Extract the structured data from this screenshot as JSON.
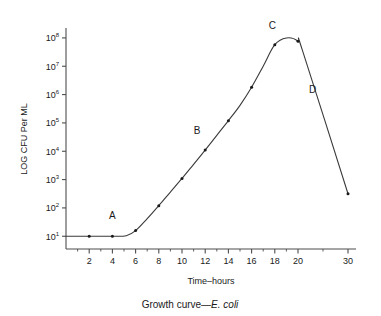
{
  "chart_data": {
    "type": "line",
    "title": "",
    "caption_prefix": "Growth curve—",
    "caption_italic": "E. coli",
    "xlabel": "Time–hours",
    "ylabel": "LOG CFU Per ML",
    "x_tick_labels": [
      "2",
      "4",
      "6",
      "8",
      "10",
      "12",
      "14",
      "16",
      "18",
      "20",
      "30"
    ],
    "x_tick_values": [
      2,
      4,
      6,
      8,
      10,
      12,
      14,
      16,
      18,
      20,
      30
    ],
    "x_minor_tick_values": [
      1,
      3,
      5,
      7,
      9,
      11,
      13,
      15,
      17,
      19,
      25
    ],
    "y_tick_labels": [
      "10¹",
      "10²",
      "10³",
      "10⁴",
      "10⁵",
      "10⁶",
      "10⁷",
      "10⁸"
    ],
    "y_tick_mantissa": "10",
    "y_tick_exponents": [
      "1",
      "2",
      "3",
      "4",
      "5",
      "6",
      "7",
      "8"
    ],
    "y_tick_values": [
      10,
      100,
      1000,
      10000,
      100000,
      1000000,
      10000000,
      100000000
    ],
    "ylim_log10": [
      0.55,
      8.35
    ],
    "xlim": [
      0,
      31.6
    ],
    "grid": false,
    "legend": false,
    "axis_break_after": 20,
    "series": [
      {
        "name": "E. coli growth curve",
        "x": [
          0,
          2,
          4,
          5.2,
          6,
          7,
          8,
          9,
          10,
          11,
          12,
          13,
          14,
          15,
          16,
          17,
          18,
          19,
          20,
          21,
          30
        ],
        "y_log10": [
          1.0,
          1.0,
          1.0,
          1.02,
          1.2,
          1.62,
          2.08,
          2.56,
          3.04,
          3.54,
          4.04,
          4.56,
          5.08,
          5.62,
          6.26,
          7.0,
          7.76,
          8.0,
          7.88,
          7.5,
          2.5
        ],
        "marker_x": [
          2,
          4,
          6,
          8,
          10,
          12,
          14,
          16,
          18,
          20,
          30
        ],
        "marker_y_log10": [
          1.0,
          1.0,
          1.2,
          2.08,
          3.04,
          4.04,
          5.08,
          6.26,
          7.76,
          7.88,
          2.5
        ]
      }
    ],
    "annotations": [
      {
        "label": "A",
        "phase": "lag",
        "x": 4.0,
        "y_log10": 1.62
      },
      {
        "label": "B",
        "phase": "log",
        "x": 11.3,
        "y_log10": 4.62
      },
      {
        "label": "C",
        "phase": "stationary",
        "x": 17.8,
        "y_log10": 8.3
      },
      {
        "label": "D",
        "phase": "death",
        "x": 22.9,
        "y_log10": 6.05
      }
    ]
  }
}
